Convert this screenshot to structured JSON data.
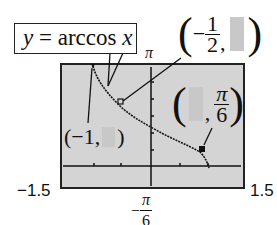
{
  "callout": {
    "lhs": "y",
    "eq": " = arccos ",
    "var": "x"
  },
  "window": {
    "xmin_label": "−1.5",
    "xmax_label": "1.5",
    "ymax_label": "π",
    "ymin_label": {
      "sign": "−",
      "num": "π",
      "den": "6"
    }
  },
  "points": [
    {
      "name": "left-endpoint",
      "x_label": "(−1,",
      "y_label": ")",
      "y_hidden": true
    },
    {
      "name": "mid-point",
      "open": "(",
      "x_sign": "−",
      "x_num": "1",
      "x_den": "2",
      "comma": ",",
      "close": ")",
      "y_hidden": true
    },
    {
      "name": "right-point",
      "open": "(",
      "comma": ",",
      "y_num": "π",
      "y_den": "6",
      "close": ")",
      "x_hidden": true
    }
  ],
  "colors": {
    "screen": "#d4d4d4",
    "curve": "#111111",
    "hidden_box": "#c8c8c8"
  }
}
